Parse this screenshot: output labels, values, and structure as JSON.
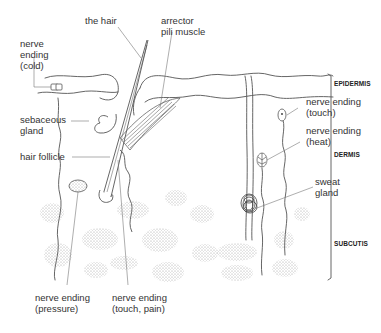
{
  "diagram": {
    "labels": {
      "hair": "the hair",
      "arrector_line1": "arrector",
      "arrector_line2": "pili muscle",
      "cold_line1": "nerve",
      "cold_line2": "ending",
      "cold_line3": "(cold)",
      "sebaceous_line1": "sebaceous",
      "sebaceous_line2": "gland",
      "follicle": "hair follicle",
      "pressure_line1": "nerve ending",
      "pressure_line2": "(pressure)",
      "touchpain_line1": "nerve ending",
      "touchpain_line2": "(touch, pain)",
      "touch_line1": "nerve ending",
      "touch_line2": "(touch)",
      "heat_line1": "nerve ending",
      "heat_line2": "(heat)",
      "sweat_line1": "sweat",
      "sweat_line2": "gland"
    },
    "layers": {
      "epidermis": "EPIDERMIS",
      "dermis": "DERMIS",
      "subcutis": "SUBCUTIS"
    },
    "colors": {
      "line": "#555555",
      "fat": "#8a8a8a",
      "background": "#ffffff"
    }
  }
}
